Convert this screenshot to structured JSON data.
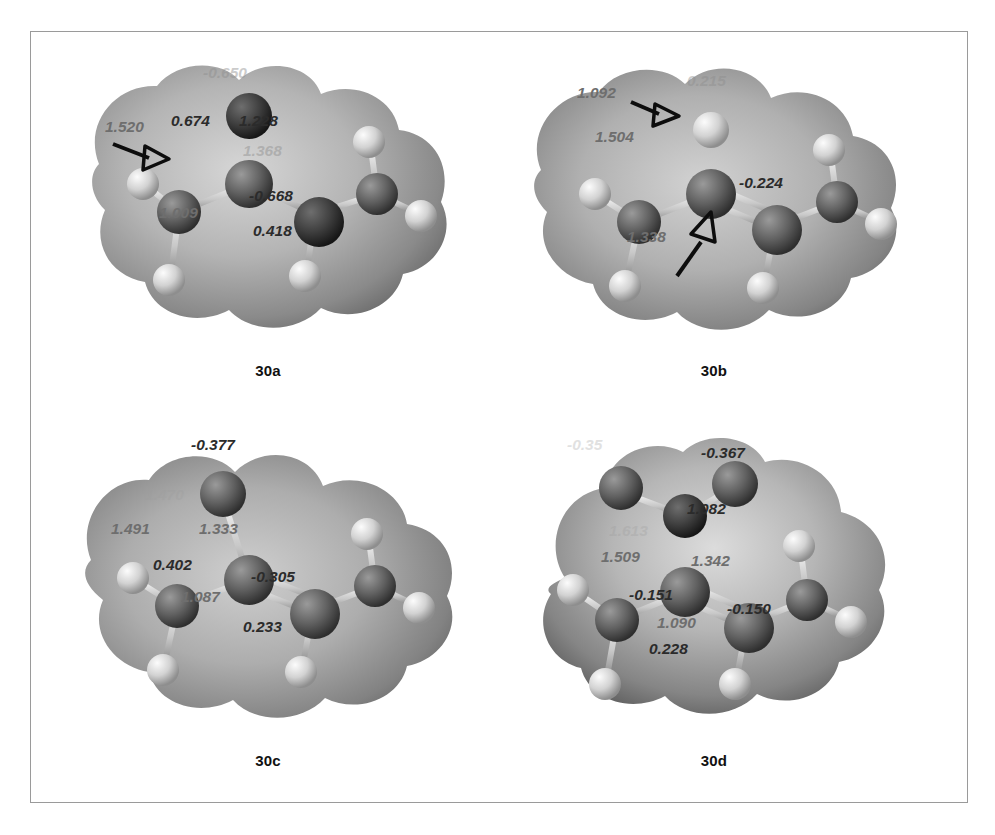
{
  "figure": {
    "panels": [
      {
        "id": "30a",
        "caption": "30a",
        "labels": [
          {
            "name": "bond-length-c1-c2",
            "text": "1.520",
            "kind": "bond",
            "x": 52,
            "y": 86
          },
          {
            "name": "charge-c2",
            "text": "0.674",
            "kind": "charge",
            "x": 118,
            "y": 80
          },
          {
            "name": "bond-length-c2-o",
            "text": "1.228",
            "kind": "charge",
            "x": 186,
            "y": 80
          },
          {
            "name": "charge-oxygen",
            "text": "-0.650",
            "kind": "faint",
            "x": 150,
            "y": 32
          },
          {
            "name": "bond-length-c2-c3",
            "text": "1.368",
            "kind": "faint",
            "x": 190,
            "y": 110
          },
          {
            "name": "bond-length-c3-h",
            "text": "1.009",
            "kind": "bond",
            "x": 106,
            "y": 172
          },
          {
            "name": "charge-c3",
            "text": "-0.668",
            "kind": "charge",
            "x": 196,
            "y": 155
          },
          {
            "name": "charge-h3",
            "text": "0.418",
            "kind": "charge",
            "x": 200,
            "y": 190
          }
        ]
      },
      {
        "id": "30b",
        "caption": "30b",
        "labels": [
          {
            "name": "bond-length-c-h",
            "text": "1.092",
            "kind": "bond",
            "x": 78,
            "y": 52
          },
          {
            "name": "charge-h-vinyl",
            "text": "0.215",
            "kind": "faint",
            "x": 188,
            "y": 40
          },
          {
            "name": "bond-length-c1-c2",
            "text": "1.504",
            "kind": "bond",
            "x": 96,
            "y": 96
          },
          {
            "name": "charge-c3",
            "text": "-0.224",
            "kind": "charge",
            "x": 240,
            "y": 142
          },
          {
            "name": "bond-length-c2-c3",
            "text": "1.338",
            "kind": "bond",
            "x": 128,
            "y": 196
          }
        ]
      },
      {
        "id": "30c",
        "caption": "30c",
        "labels": [
          {
            "name": "charge-methyl-top",
            "text": "-0.377",
            "kind": "charge",
            "x": 138,
            "y": 18
          },
          {
            "name": "bond-length-hidden",
            "text": "1.470",
            "kind": "vfaint",
            "x": 92,
            "y": 68
          },
          {
            "name": "bond-length-c1-c2",
            "text": "1.491",
            "kind": "bond",
            "x": 58,
            "y": 102
          },
          {
            "name": "bond-length-c2-c3",
            "text": "1.333",
            "kind": "bond",
            "x": 146,
            "y": 102
          },
          {
            "name": "charge-c2",
            "text": "0.402",
            "kind": "charge",
            "x": 100,
            "y": 138
          },
          {
            "name": "charge-c3",
            "text": "-0.305",
            "kind": "charge",
            "x": 198,
            "y": 150
          },
          {
            "name": "bond-length-c3-h",
            "text": "1.087",
            "kind": "bond",
            "x": 128,
            "y": 170
          },
          {
            "name": "charge-h3",
            "text": "0.233",
            "kind": "charge",
            "x": 190,
            "y": 200
          }
        ]
      },
      {
        "id": "30d",
        "caption": "30d",
        "labels": [
          {
            "name": "charge-obscured",
            "text": "-0.35",
            "kind": "vfaint",
            "x": 68,
            "y": 18
          },
          {
            "name": "charge-methyl-top",
            "text": "-0.367",
            "kind": "charge",
            "x": 202,
            "y": 26
          },
          {
            "name": "bond-length-c-h-top",
            "text": "1.082",
            "kind": "charge",
            "x": 188,
            "y": 82
          },
          {
            "name": "bond-length-hidden",
            "text": "1.613",
            "kind": "vfaint",
            "x": 110,
            "y": 104
          },
          {
            "name": "bond-length-c1-c2",
            "text": "1.509",
            "kind": "bond",
            "x": 102,
            "y": 130
          },
          {
            "name": "bond-length-c2-c3",
            "text": "1.342",
            "kind": "bond",
            "x": 192,
            "y": 134
          },
          {
            "name": "charge-c1",
            "text": "-0.151",
            "kind": "charge",
            "x": 130,
            "y": 168
          },
          {
            "name": "charge-c3",
            "text": "-0.150",
            "kind": "charge",
            "x": 228,
            "y": 182
          },
          {
            "name": "bond-length-c3-h",
            "text": "1.090",
            "kind": "bond",
            "x": 158,
            "y": 196
          },
          {
            "name": "charge-h3",
            "text": "0.228",
            "kind": "charge",
            "x": 150,
            "y": 222
          }
        ]
      }
    ],
    "colors": {
      "charge_label": "#2b2b2b",
      "bond_label": "#6e6e6e",
      "carbon_atom": "#5a5a5a",
      "hydrogen_atom": "#d9d9d9",
      "oxygen_atom": "#3c3c3c",
      "frame_border": "#9a9a9a"
    }
  }
}
